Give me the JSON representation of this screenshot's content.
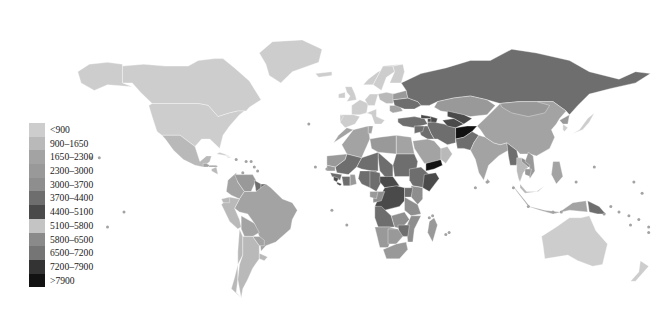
{
  "figure": {
    "type": "choropleth-world-map",
    "title": "",
    "background_color": "#ffffff",
    "border_color": "#ffffff"
  },
  "chart_data": {
    "type": "heatmap",
    "title": "",
    "subtitle": "",
    "xlabel": "",
    "ylabel": "",
    "grid": false,
    "legend_position": "left",
    "map_projection": "equirectangular-style world map",
    "no_data_color": "#ffffff",
    "classes": [
      {
        "label": "<900",
        "min": 0,
        "max": 900,
        "color": "#cdcdcd"
      },
      {
        "label": "900–1650",
        "min": 900,
        "max": 1650,
        "color": "#b9b9b9"
      },
      {
        "label": "1650–2300",
        "min": 1650,
        "max": 2300,
        "color": "#a3a3a3"
      },
      {
        "label": "2300–3000",
        "min": 2300,
        "max": 3000,
        "color": "#999999"
      },
      {
        "label": "3000–3700",
        "min": 3000,
        "max": 3700,
        "color": "#8e8e8e"
      },
      {
        "label": "3700–4400",
        "min": 3700,
        "max": 4400,
        "color": "#6e6e6e"
      },
      {
        "label": "4400–5100",
        "min": 4400,
        "max": 5100,
        "color": "#4a4a4a"
      },
      {
        "label": "5100–5800",
        "min": 5100,
        "max": 5800,
        "color": "#c4c4c4"
      },
      {
        "label": "5800–6500",
        "min": 5800,
        "max": 6500,
        "color": "#8a8a8a"
      },
      {
        "label": "6500–7200",
        "min": 6500,
        "max": 7200,
        "color": "#757575"
      },
      {
        "label": "7200–7900",
        "min": 7200,
        "max": 7900,
        "color": "#333333"
      },
      {
        "label": ">7900",
        "min": 7900,
        "max": null,
        "color": "#121212"
      }
    ],
    "regions": [
      {
        "name": "Canada",
        "class": 0,
        "value_label": "<900"
      },
      {
        "name": "United States",
        "class": 0,
        "value_label": "<900"
      },
      {
        "name": "Greenland",
        "class": 0,
        "value_label": "<900"
      },
      {
        "name": "Mexico",
        "class": 1,
        "value_label": "900–1650"
      },
      {
        "name": "Guatemala",
        "class": 2,
        "value_label": "1650–2300"
      },
      {
        "name": "Honduras",
        "class": 2,
        "value_label": "1650–2300"
      },
      {
        "name": "Nicaragua",
        "class": 1,
        "value_label": "900–1650"
      },
      {
        "name": "Cuba",
        "class": 0,
        "value_label": "<900"
      },
      {
        "name": "Colombia",
        "class": 2,
        "value_label": "1650–2300"
      },
      {
        "name": "Venezuela",
        "class": 3,
        "value_label": "2300–3000"
      },
      {
        "name": "Guyana",
        "class": 5,
        "value_label": "3700–4400"
      },
      {
        "name": "Suriname",
        "class": 5,
        "value_label": "3700–4400"
      },
      {
        "name": "Brazil",
        "class": 2,
        "value_label": "1650–2300"
      },
      {
        "name": "Peru",
        "class": 1,
        "value_label": "900–1650"
      },
      {
        "name": "Bolivia",
        "class": 2,
        "value_label": "1650–2300"
      },
      {
        "name": "Chile",
        "class": 1,
        "value_label": "900–1650"
      },
      {
        "name": "Argentina",
        "class": 1,
        "value_label": "900–1650"
      },
      {
        "name": "Paraguay",
        "class": 2,
        "value_label": "1650–2300"
      },
      {
        "name": "Norway",
        "class": 0,
        "value_label": "<900"
      },
      {
        "name": "Sweden",
        "class": 0,
        "value_label": "<900"
      },
      {
        "name": "Finland",
        "class": 0,
        "value_label": "<900"
      },
      {
        "name": "United Kingdom",
        "class": 0,
        "value_label": "<900"
      },
      {
        "name": "France",
        "class": 0,
        "value_label": "<900"
      },
      {
        "name": "Spain",
        "class": 0,
        "value_label": "<900"
      },
      {
        "name": "Germany",
        "class": 0,
        "value_label": "<900"
      },
      {
        "name": "Poland",
        "class": 1,
        "value_label": "900–1650"
      },
      {
        "name": "Italy",
        "class": 0,
        "value_label": "<900"
      },
      {
        "name": "Romania",
        "class": 2,
        "value_label": "1650–2300"
      },
      {
        "name": "Ukraine",
        "class": 5,
        "value_label": "3700–4400"
      },
      {
        "name": "Belarus",
        "class": 3,
        "value_label": "2300–3000"
      },
      {
        "name": "Russia",
        "class": 5,
        "value_label": "3700–4400"
      },
      {
        "name": "Kazakhstan",
        "class": 3,
        "value_label": "2300–3000"
      },
      {
        "name": "Turkey",
        "class": 5,
        "value_label": "3700–4400"
      },
      {
        "name": "Georgia",
        "class": 6,
        "value_label": "4400–5100"
      },
      {
        "name": "Azerbaijan",
        "class": 6,
        "value_label": "4400–5100"
      },
      {
        "name": "Iran",
        "class": 5,
        "value_label": "3700–4400"
      },
      {
        "name": "Iraq",
        "class": 5,
        "value_label": "3700–4400"
      },
      {
        "name": "Afghanistan",
        "class": 11,
        "value_label": ">7900"
      },
      {
        "name": "Pakistan",
        "class": 5,
        "value_label": "3700–4400"
      },
      {
        "name": "Turkmenistan",
        "class": 6,
        "value_label": "4400–5100"
      },
      {
        "name": "Uzbekistan",
        "class": 6,
        "value_label": "4400–5100"
      },
      {
        "name": "Saudi Arabia",
        "class": 2,
        "value_label": "1650–2300"
      },
      {
        "name": "Yemen",
        "class": 11,
        "value_label": ">7900"
      },
      {
        "name": "Oman",
        "class": 1,
        "value_label": "900–1650"
      },
      {
        "name": "India",
        "class": 2,
        "value_label": "1650–2300"
      },
      {
        "name": "China",
        "class": 2,
        "value_label": "1650–2300"
      },
      {
        "name": "Mongolia",
        "class": 3,
        "value_label": "2300–3000"
      },
      {
        "name": "Myanmar",
        "class": 5,
        "value_label": "3700–4400"
      },
      {
        "name": "Thailand",
        "class": 1,
        "value_label": "900–1650"
      },
      {
        "name": "Laos",
        "class": 4,
        "value_label": "3000–3700"
      },
      {
        "name": "Vietnam",
        "class": 3,
        "value_label": "2300–3000"
      },
      {
        "name": "Cambodia",
        "class": 3,
        "value_label": "2300–3000"
      },
      {
        "name": "Malaysia",
        "class": 1,
        "value_label": "900–1650"
      },
      {
        "name": "Indonesia",
        "class": 2,
        "value_label": "1650–2300"
      },
      {
        "name": "Philippines",
        "class": 2,
        "value_label": "1650–2300"
      },
      {
        "name": "Japan",
        "class": 0,
        "value_label": "<900"
      },
      {
        "name": "South Korea",
        "class": 0,
        "value_label": "<900"
      },
      {
        "name": "North Korea",
        "class": 3,
        "value_label": "2300–3000"
      },
      {
        "name": "Papua New Guinea",
        "class": 5,
        "value_label": "3700–4400"
      },
      {
        "name": "Australia",
        "class": 0,
        "value_label": "<900"
      },
      {
        "name": "New Zealand",
        "class": 0,
        "value_label": "<900"
      },
      {
        "name": "Morocco",
        "class": 2,
        "value_label": "1650–2300"
      },
      {
        "name": "Algeria",
        "class": 2,
        "value_label": "1650–2300"
      },
      {
        "name": "Libya",
        "class": 3,
        "value_label": "2300–3000"
      },
      {
        "name": "Egypt",
        "class": 2,
        "value_label": "1650–2300"
      },
      {
        "name": "Sudan",
        "class": 5,
        "value_label": "3700–4400"
      },
      {
        "name": "Chad",
        "class": 5,
        "value_label": "3700–4400"
      },
      {
        "name": "Niger",
        "class": 5,
        "value_label": "3700–4400"
      },
      {
        "name": "Mali",
        "class": 5,
        "value_label": "3700–4400"
      },
      {
        "name": "Mauritania",
        "class": 3,
        "value_label": "2300–3000"
      },
      {
        "name": "Senegal",
        "class": 3,
        "value_label": "2300–3000"
      },
      {
        "name": "Guinea",
        "class": 5,
        "value_label": "3700–4400"
      },
      {
        "name": "Sierra Leone",
        "class": 6,
        "value_label": "4400–5100"
      },
      {
        "name": "Liberia",
        "class": 6,
        "value_label": "4400–5100"
      },
      {
        "name": "Côte d'Ivoire",
        "class": 5,
        "value_label": "3700–4400"
      },
      {
        "name": "Ghana",
        "class": 3,
        "value_label": "2300–3000"
      },
      {
        "name": "Nigeria",
        "class": 5,
        "value_label": "3700–4400"
      },
      {
        "name": "Cameroon",
        "class": 5,
        "value_label": "3700–4400"
      },
      {
        "name": "Central African Republic",
        "class": 6,
        "value_label": "4400–5100"
      },
      {
        "name": "Ethiopia",
        "class": 5,
        "value_label": "3700–4400"
      },
      {
        "name": "Somalia",
        "class": 6,
        "value_label": "4400–5100"
      },
      {
        "name": "Kenya",
        "class": 4,
        "value_label": "3000–3700"
      },
      {
        "name": "Uganda",
        "class": 5,
        "value_label": "3700–4400"
      },
      {
        "name": "DR Congo",
        "class": 6,
        "value_label": "4400–5100"
      },
      {
        "name": "Congo",
        "class": 4,
        "value_label": "3000–3700"
      },
      {
        "name": "Gabon",
        "class": 3,
        "value_label": "2300–3000"
      },
      {
        "name": "Angola",
        "class": 5,
        "value_label": "3700–4400"
      },
      {
        "name": "Zambia",
        "class": 4,
        "value_label": "3000–3700"
      },
      {
        "name": "Tanzania",
        "class": 4,
        "value_label": "3000–3700"
      },
      {
        "name": "Mozambique",
        "class": 4,
        "value_label": "3000–3700"
      },
      {
        "name": "Zimbabwe",
        "class": 5,
        "value_label": "3700–4400"
      },
      {
        "name": "Madagascar",
        "class": 3,
        "value_label": "2300–3000"
      },
      {
        "name": "Namibia",
        "class": 3,
        "value_label": "2300–3000"
      },
      {
        "name": "Botswana",
        "class": 3,
        "value_label": "2300–3000"
      },
      {
        "name": "South Africa",
        "class": 3,
        "value_label": "2300–3000"
      }
    ]
  },
  "legend": {
    "name": "map-legend",
    "orientation": "vertical",
    "items": [
      {
        "label": "<900",
        "color": "#cdcdcd"
      },
      {
        "label": "900–1650",
        "color": "#b9b9b9"
      },
      {
        "label": "1650–2300",
        "color": "#a3a3a3"
      },
      {
        "label": "2300–3000",
        "color": "#999999"
      },
      {
        "label": "3000–3700",
        "color": "#8e8e8e"
      },
      {
        "label": "3700–4400",
        "color": "#6e6e6e"
      },
      {
        "label": "4400–5100",
        "color": "#4a4a4a"
      },
      {
        "label": "5100–5800",
        "color": "#c4c4c4"
      },
      {
        "label": "5800–6500",
        "color": "#8a8a8a"
      },
      {
        "label": "6500–7200",
        "color": "#757575"
      },
      {
        "label": "7200–7900",
        "color": "#333333"
      },
      {
        "label": ">7900",
        "color": "#121212"
      }
    ]
  }
}
